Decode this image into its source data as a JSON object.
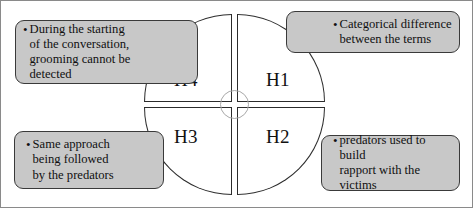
{
  "figure": {
    "colors": {
      "box_fill": "#c8c8c8",
      "box_border": "#3a3a3a",
      "quadrant_fill": "#ffffff",
      "quadrant_border": "#2b2b2b",
      "hub_circle_border": "#a8a8a8",
      "frame_border": "#8a8a8a",
      "text": "#101010"
    },
    "bullet_glyph": "•"
  },
  "quadrants": [
    {
      "id": "h4",
      "label": "H4",
      "position": "top-left"
    },
    {
      "id": "h1",
      "label": "H1",
      "position": "top-right"
    },
    {
      "id": "h3",
      "label": "H3",
      "position": "bottom-left"
    },
    {
      "id": "h2",
      "label": "H2",
      "position": "bottom-right"
    }
  ],
  "callouts": [
    {
      "id": "h4-callout",
      "position": "top-left",
      "text": "During  the starting\nof the conversation,\ngrooming  cannot be\ndetected"
    },
    {
      "id": "h1-callout",
      "position": "top-right",
      "text": "Categorical  difference\nbetween the terms"
    },
    {
      "id": "h3-callout",
      "position": "bottom-left",
      "text": "Same approach\nbeing  followed\nby the  predators"
    },
    {
      "id": "h2-callout",
      "position": "bottom-right",
      "text": "predators used to  build\nrapport  with  the\nvictims"
    }
  ]
}
